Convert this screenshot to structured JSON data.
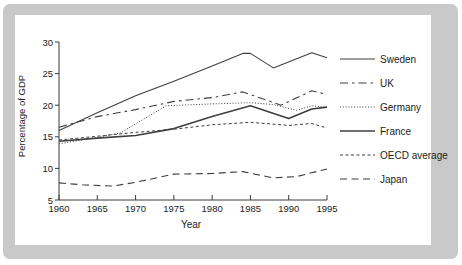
{
  "frame": {
    "outer_background": "#ffffff",
    "border_color": "#c9c9c9",
    "panel_background": "#ffffff"
  },
  "chart_data": {
    "type": "line",
    "title": "",
    "xlabel": "Year",
    "ylabel": "Percentage of GDP",
    "xlim": [
      1960,
      1995
    ],
    "ylim": [
      5,
      30
    ],
    "x_ticks": [
      1960,
      1965,
      1970,
      1975,
      1980,
      1985,
      1990,
      1995
    ],
    "y_ticks": [
      30,
      25,
      20,
      15,
      10,
      5
    ],
    "grid": false,
    "legend_position": "right",
    "line_color": "#3f3f3f",
    "text_color": "#1c1c1c",
    "series": [
      {
        "name": "Sweden",
        "style": "solid",
        "width": 1.1,
        "dash": "",
        "points": [
          [
            1960,
            16.0
          ],
          [
            1965,
            18.8
          ],
          [
            1970,
            21.5
          ],
          [
            1975,
            23.8
          ],
          [
            1980,
            26.2
          ],
          [
            1984,
            28.2
          ],
          [
            1985,
            28.2
          ],
          [
            1988,
            25.9
          ],
          [
            1993,
            28.3
          ],
          [
            1995,
            27.5
          ]
        ]
      },
      {
        "name": "UK",
        "style": "dash-dot",
        "width": 1.1,
        "dash": "8,4,2.5,4",
        "points": [
          [
            1960,
            16.5
          ],
          [
            1965,
            18.2
          ],
          [
            1970,
            19.3
          ],
          [
            1975,
            20.6
          ],
          [
            1980,
            21.2
          ],
          [
            1984,
            22.1
          ],
          [
            1989,
            20.0
          ],
          [
            1993,
            22.3
          ],
          [
            1995,
            21.7
          ]
        ]
      },
      {
        "name": "Germany",
        "style": "dotted",
        "width": 1.0,
        "dash": "1,1.8",
        "points": [
          [
            1960,
            13.9
          ],
          [
            1965,
            14.9
          ],
          [
            1968,
            15.6
          ],
          [
            1974,
            19.9
          ],
          [
            1980,
            20.2
          ],
          [
            1985,
            20.4
          ],
          [
            1988,
            20.1
          ],
          [
            1991,
            19.2
          ],
          [
            1993,
            19.9
          ],
          [
            1995,
            19.7
          ]
        ]
      },
      {
        "name": "France",
        "style": "solid",
        "width": 1.6,
        "dash": "",
        "points": [
          [
            1960,
            14.3
          ],
          [
            1965,
            14.8
          ],
          [
            1970,
            15.2
          ],
          [
            1975,
            16.3
          ],
          [
            1980,
            18.2
          ],
          [
            1985,
            19.9
          ],
          [
            1990,
            17.9
          ],
          [
            1993,
            19.4
          ],
          [
            1995,
            19.7
          ]
        ]
      },
      {
        "name": "OECD average",
        "style": "short-dash",
        "width": 1.0,
        "dash": "3,2.5",
        "points": [
          [
            1960,
            14.5
          ],
          [
            1965,
            15.1
          ],
          [
            1970,
            15.7
          ],
          [
            1975,
            16.2
          ],
          [
            1980,
            16.9
          ],
          [
            1985,
            17.3
          ],
          [
            1990,
            16.8
          ],
          [
            1993,
            17.1
          ],
          [
            1995,
            16.4
          ]
        ]
      },
      {
        "name": "Japan",
        "style": "long-dash",
        "width": 1.1,
        "dash": "7,4.5",
        "points": [
          [
            1960,
            7.7
          ],
          [
            1963,
            7.4
          ],
          [
            1967,
            7.2
          ],
          [
            1970,
            7.8
          ],
          [
            1975,
            9.1
          ],
          [
            1980,
            9.2
          ],
          [
            1984,
            9.5
          ],
          [
            1988,
            8.5
          ],
          [
            1991,
            8.7
          ],
          [
            1995,
            9.9
          ]
        ]
      }
    ]
  }
}
